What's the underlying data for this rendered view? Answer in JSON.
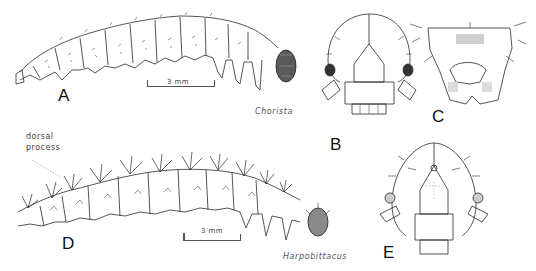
{
  "figure": {
    "panels": [
      {
        "letter": "A",
        "description": "Larva, lateral view"
      },
      {
        "letter": "B",
        "description": "Head capsule, frontal view"
      },
      {
        "letter": "C",
        "description": "Head, ventral/posterior view"
      },
      {
        "letter": "D",
        "description": "Larva, lateral view with dorsal processes"
      },
      {
        "letter": "E",
        "description": "Head capsule, frontal view"
      }
    ],
    "genera": {
      "top": "Chorista",
      "bottom": "Harpobittacus"
    },
    "annotations": {
      "dorsal_process_line1": "dorsal",
      "dorsal_process_line2": "process"
    },
    "scale_bars": {
      "top": "3 mm",
      "bottom": "3 mm"
    },
    "colors": {
      "ink": "#1a1a1a",
      "background": "#ffffff",
      "label_gray": "#555555"
    }
  }
}
